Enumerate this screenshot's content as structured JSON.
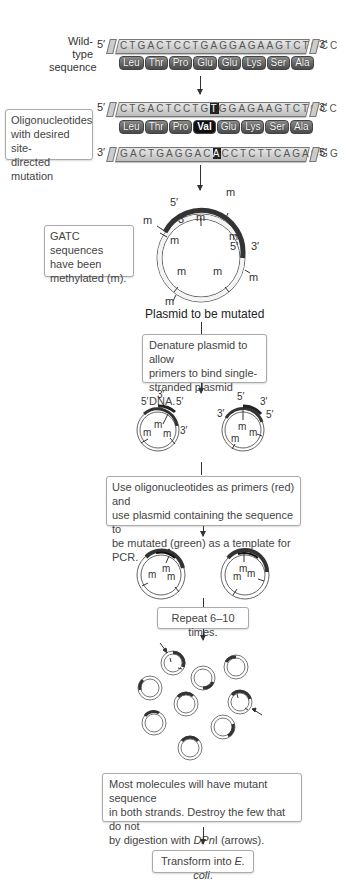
{
  "wild_type": {
    "label_line1": "Wild-type",
    "label_line2": "sequence",
    "five_prime": "5′",
    "three_prime": "3′",
    "sequence": "CTGACTCCTGAGGAGAAGTCTGCC",
    "amino_acids": [
      "Leu",
      "Thr",
      "Pro",
      "Glu",
      "Glu",
      "Lys",
      "Ser",
      "Ala"
    ]
  },
  "mutant": {
    "label": "Oligonucleotides with desired site-directed mutation",
    "label_lines": [
      "Oligonucleotides",
      "with desired site-",
      "directed mutation"
    ],
    "top_five": "5′",
    "top_three": "3′",
    "top_seq_before": "CTGACTCCTG",
    "top_seq_mut": "T",
    "top_seq_after": "GGAGAAGTCTGCC",
    "amino_acids": [
      "Leu",
      "Thr",
      "Pro",
      "Val",
      "Glu",
      "Lys",
      "Ser",
      "Ala"
    ],
    "mutated_index": 3,
    "bottom_three": "3′",
    "bottom_five": "5′",
    "bottom_seq_before": "GACTGAGGAC",
    "bottom_seq_mut": "A",
    "bottom_seq_after": "CCTCTTCAGACGG"
  },
  "methylation": {
    "box_lines": [
      "GATC sequences",
      "have been",
      "methylated (m)."
    ],
    "m": "m",
    "five": "5′",
    "three": "3′",
    "caption": "Plasmid to be mutated"
  },
  "steps": {
    "denature": [
      "Denature plasmid to allow",
      "primers to bind single-",
      "stranded plasmid DNA."
    ],
    "pcr": [
      "Use oligonucleotides as primers (red) and",
      "use plasmid containing the sequence to",
      "be mutated (green) as a template for PCR."
    ],
    "repeat": "Repeat 6–10 times.",
    "digest_line1": "Most molecules will have mutant sequence",
    "digest_line2": "in both strands. Destroy the few that do not",
    "digest_line3_pre": "by digestion with ",
    "digest_line3_em": "DPn",
    "digest_line3_post": "I (arrows).",
    "transform_pre": "Transform into ",
    "transform_em": "E. coli",
    "transform_post": "."
  },
  "colors": {
    "primer": "#444444",
    "template": "#555555",
    "text": "#333333"
  }
}
